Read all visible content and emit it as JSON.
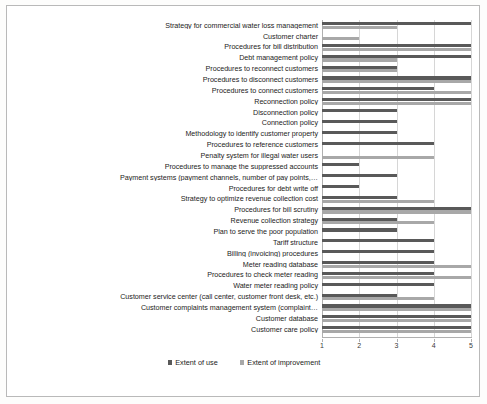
{
  "chart_data": {
    "type": "bar",
    "orientation": "horizontal",
    "title": "",
    "xlabel": "",
    "ylabel": "",
    "xlim": [
      1,
      5
    ],
    "xticks": [
      1,
      2,
      3,
      4,
      5
    ],
    "grid": true,
    "legend_position": "bottom",
    "legend": [
      "Extent of use",
      "Extent of improvement"
    ],
    "colors": {
      "extent_of_use": "#595959",
      "extent_of_improvement": "#a8a8a8",
      "gridline": "#d6d6d6",
      "axis": "#b0b0b0",
      "text": "#1d1d1b",
      "border": "#b9b9b9",
      "background": "#ffffff"
    },
    "categories": [
      "Strategy for commercial water loss management",
      "Customer charter",
      "Procedures for bill distribution",
      "Debt management policy",
      "Procedures to reconnect customers",
      "Procedures to disconnect customers",
      "Procedures to connect customers",
      "Reconnection policy",
      "Disconnection policy",
      "Connection policy",
      "Methodology to identify customer property",
      "Procedures to reference customers",
      "Penalty system  for illegal water users",
      "Procedures to manage the suppressed accounts",
      "Payment systems (payment channels, number of pay points,…",
      "Procedures for debt write off",
      "Strategy to optimize revenue collection cost",
      "Procedures for bill scrutiny",
      "Revenue collection strategy",
      "Plan to serve the poor population",
      "Tariff structure",
      "Billing (invoicing) procedures",
      "Meter reading database",
      "Procedures to check meter reading",
      "Water meter reading policy",
      "Customer service center (call center, customer front desk, etc.)",
      "Customer complaints management system (complaint…",
      "Customer database",
      "Customer care policy"
    ],
    "series": [
      {
        "name": "Extent of use",
        "color": "#595959",
        "values": [
          5,
          1,
          5,
          5,
          3,
          5,
          4,
          5,
          3,
          3,
          3,
          4,
          1,
          2,
          3,
          2,
          3,
          5,
          3,
          3,
          4,
          4,
          4,
          4,
          4,
          3,
          5,
          5,
          5
        ]
      },
      {
        "name": "Extent of improvement",
        "color": "#a8a8a8",
        "values": [
          3,
          2,
          5,
          3,
          3,
          5,
          5,
          5,
          1,
          1,
          1,
          1,
          4,
          1,
          1,
          1,
          4,
          5,
          4,
          1,
          1,
          1,
          5,
          5,
          1,
          4,
          5,
          5,
          5
        ]
      }
    ]
  },
  "axis": {
    "tick_labels": [
      "1",
      "2",
      "3",
      "4",
      "5"
    ]
  },
  "legend": {
    "items": [
      {
        "label": "Extent of use",
        "swatch": "use"
      },
      {
        "label": "Extent of improvement",
        "swatch": "improve"
      }
    ]
  }
}
